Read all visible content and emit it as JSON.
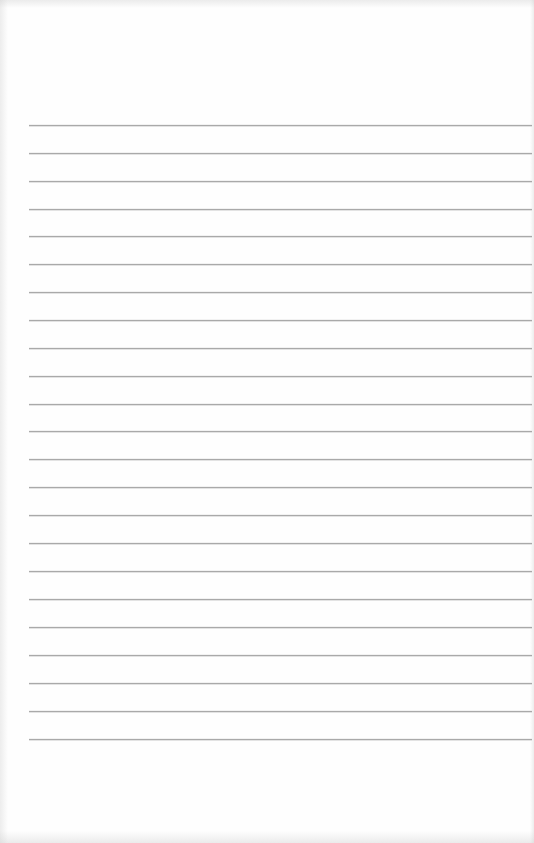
{
  "paper": {
    "type": "lined-paper",
    "background_color": "#fefefe",
    "rule_color": "#a9a9a9",
    "rule_left": 29,
    "rule_width": 503,
    "rule_count": 23,
    "rule_positions": [
      125,
      153,
      181,
      209,
      236,
      264,
      292,
      320,
      348,
      376,
      404,
      431,
      459,
      487,
      515,
      543,
      571,
      599,
      627,
      655,
      683,
      711,
      739
    ]
  }
}
